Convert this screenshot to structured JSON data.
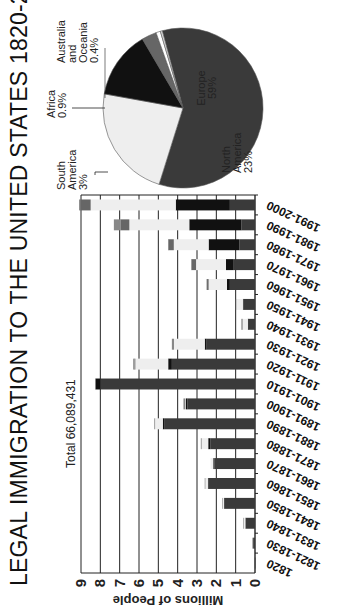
{
  "title": "LEGAL IMMIGRATION TO THE UNITED STATES 1820-2000",
  "total_label": "Total 66,089,431",
  "colors": {
    "europe": "#3a3a3a",
    "asia": "#111111",
    "north_america": "#eeeeee",
    "south_america": "#666666",
    "africa": "#ffffff",
    "australia_oceania": "#dddddd",
    "grid": "#222222"
  },
  "chart_data": [
    {
      "type": "bar",
      "orientation": "vertical",
      "stacked": true,
      "title": "LEGAL IMMIGRATION TO THE UNITED STATES 1820-2000",
      "annotation": "Total 66,089,431",
      "xlabel": "",
      "ylabel": "Millions of People",
      "ylim": [
        0,
        9
      ],
      "yticks": [
        "0",
        "1",
        "2",
        "3",
        "4",
        "5",
        "6",
        "7",
        "8",
        "9"
      ],
      "grid": true,
      "categories": [
        "1820",
        "1821-1830",
        "1831-1840",
        "1841-1850",
        "1851-1860",
        "1861-1870",
        "1871-1880",
        "1881-1890",
        "1891-1900",
        "1901-1910",
        "1911-1920",
        "1921-1930",
        "1931-1940",
        "1941-1950",
        "1951-1960",
        "1961-1970",
        "1971-1980",
        "1981-1990",
        "1991-2000"
      ],
      "totals": [
        0.008,
        0.14,
        0.6,
        1.7,
        2.6,
        2.3,
        2.8,
        5.2,
        3.7,
        8.2,
        6.3,
        4.3,
        0.7,
        1.0,
        2.5,
        3.3,
        4.5,
        7.3,
        9.1
      ],
      "series": [
        {
          "name": "Europe",
          "values": [
            0.008,
            0.1,
            0.5,
            1.6,
            2.4,
            2.1,
            2.3,
            4.7,
            3.5,
            8.0,
            4.3,
            2.5,
            0.35,
            0.6,
            1.3,
            1.1,
            0.8,
            0.7,
            1.3
          ]
        },
        {
          "name": "Asia",
          "values": [
            0,
            0,
            0,
            0,
            0.04,
            0.06,
            0.12,
            0.07,
            0.07,
            0.24,
            0.19,
            0.1,
            0.02,
            0.03,
            0.15,
            0.4,
            1.6,
            2.7,
            2.8
          ]
        },
        {
          "name": "North America",
          "values": [
            0,
            0.03,
            0.09,
            0.08,
            0.15,
            0.14,
            0.37,
            0.42,
            0.03,
            0.0,
            1.7,
            1.6,
            0.3,
            0.35,
            0.95,
            1.55,
            1.8,
            3.1,
            4.4
          ]
        },
        {
          "name": "South America",
          "values": [
            0,
            0,
            0,
            0,
            0,
            0,
            0.01,
            0.01,
            0,
            0.02,
            0.04,
            0.04,
            0.01,
            0.02,
            0.09,
            0.23,
            0.28,
            0.46,
            0.54
          ]
        },
        {
          "name": "Other",
          "values": [
            0,
            0.01,
            0.01,
            0.02,
            0.01,
            0,
            0,
            0,
            0.1,
            0,
            0.07,
            0.06,
            0.02,
            0,
            0.01,
            0.02,
            0.02,
            0.34,
            0.06
          ]
        }
      ]
    },
    {
      "type": "pie",
      "title": "",
      "slices": [
        {
          "label": "Europe",
          "value": 59,
          "display": "59%"
        },
        {
          "label": "North America",
          "value": 23,
          "display": "23%"
        },
        {
          "label": "Asia",
          "value": 13.7,
          "display": ""
        },
        {
          "label": "South America",
          "value": 3,
          "display": "3%"
        },
        {
          "label": "Africa",
          "value": 0.9,
          "display": "0.9%"
        },
        {
          "label": "Australia and Oceania",
          "value": 0.4,
          "display": "0.4%"
        }
      ]
    }
  ],
  "pie_labels": {
    "europe": [
      "Europe",
      "59%"
    ],
    "north_america": [
      "North",
      "America",
      "23%"
    ],
    "south_america": [
      "South",
      "America",
      "3%"
    ],
    "africa": [
      "Africa",
      "0.9%"
    ],
    "australia": [
      "Australia",
      "and",
      "Oceania",
      "0.4%"
    ]
  }
}
